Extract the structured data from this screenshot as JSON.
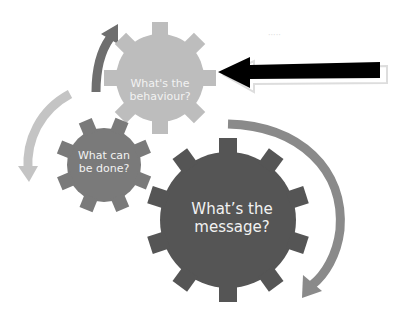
{
  "diagram": {
    "type": "gear-cycle",
    "gears": [
      {
        "id": "behaviour",
        "label_line1": "What's the",
        "label_line2": "behaviour?",
        "fill": "#bdbdbd",
        "cx": 160,
        "cy": 78,
        "r_outer": 56,
        "r_inner": 44,
        "teeth": 8
      },
      {
        "id": "done",
        "label_line1": "What can",
        "label_line2": "be done?",
        "fill": "#7a7a7a",
        "cx": 104,
        "cy": 165,
        "r_outer": 48,
        "r_inner": 37,
        "teeth": 8
      },
      {
        "id": "message",
        "label_line1": "What’s the",
        "label_line2": "message?",
        "fill": "#555555",
        "cx": 228,
        "cy": 220,
        "r_outer": 82,
        "r_inner": 68,
        "teeth": 10
      }
    ],
    "cycle_arrows": [
      {
        "id": "arrow-up-left",
        "color": "#6e6e6e"
      },
      {
        "id": "arrow-down-left",
        "color": "#c4c4c4"
      },
      {
        "id": "arrow-down-right",
        "color": "#8a8a8a"
      }
    ],
    "pointer_arrow": {
      "color": "#000000",
      "direction": "left",
      "target": "behaviour"
    },
    "faint_text": "·····"
  }
}
